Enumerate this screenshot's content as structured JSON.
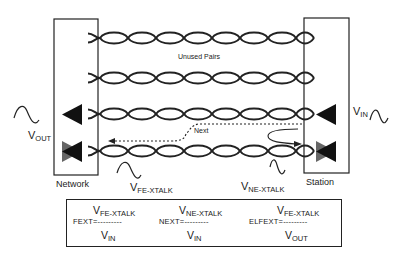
{
  "diagram": {
    "left_box": {
      "label": "Network"
    },
    "right_box": {
      "label": "Station"
    },
    "unused_pairs_label": "Unused Pairs",
    "next_label": "Next",
    "signals": {
      "v_out": {
        "main": "V",
        "sub": "OUT"
      },
      "v_in": {
        "main": "V",
        "sub": "IN"
      },
      "v_fe_xtalk": {
        "main": "V",
        "sub": "FE-XTALK"
      },
      "v_ne_xtalk": {
        "main": "V",
        "sub": "NE-XTALK"
      }
    },
    "colors": {
      "line": "#222222",
      "driver_dark": "#111111",
      "driver_gray": "#666666"
    }
  },
  "formulas": [
    {
      "name": "FEXT",
      "lhs": "FEXT=",
      "dashes": "---------",
      "num_main": "V",
      "num_sub": "FE-XTALK",
      "den_main": "V",
      "den_sub": "IN"
    },
    {
      "name": "NEXT",
      "lhs": "NEXT=",
      "dashes": "---------",
      "num_main": "V",
      "num_sub": "NE-XTALK",
      "den_main": "V",
      "den_sub": "IN"
    },
    {
      "name": "ELFEXT",
      "lhs": "ELFEXT=",
      "dashes": "---------",
      "num_main": "V",
      "num_sub": "FE-XTALK",
      "den_main": "V",
      "den_sub": "OUT"
    }
  ]
}
